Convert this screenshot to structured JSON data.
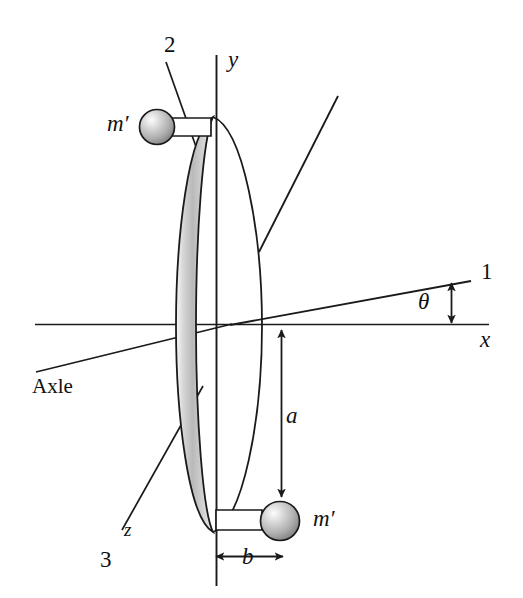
{
  "figure": {
    "kind": "mechanics-diagram",
    "colors": {
      "line": "#1a1a1a",
      "rim_light": "#f2f2f2",
      "rim_mid": "#c9c9c9",
      "rim_dark": "#9a9a9a",
      "sphere_light": "#e8e8e8",
      "sphere_mid": "#b4b4b4",
      "sphere_dark": "#6e6e6e",
      "background": "#ffffff"
    }
  },
  "labels": {
    "axis_1": "1",
    "axis_2": "2",
    "axis_3": "3",
    "axis_x": "x",
    "axis_y": "y",
    "axis_z": "z",
    "angle_theta": "θ",
    "mass_top": "m′",
    "mass_bottom": "m′",
    "dim_a": "a",
    "dim_b": "b",
    "axle": "Axle"
  },
  "annotations": {
    "dim_a_meaning": "radial distance from disk center (origin) down to lower mass",
    "dim_b_meaning": "offset of lower mass from the disk plane along the axle direction",
    "theta_meaning": "tilt angle between principal axis 1 and the x axis"
  }
}
